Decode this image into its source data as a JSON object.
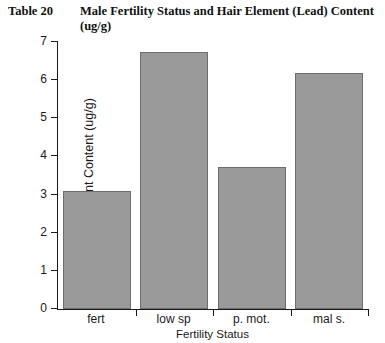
{
  "figure": {
    "table_number": "Table 20",
    "title": "Male Fertility Status and Hair Element (Lead) Content (ug/g)"
  },
  "chart_data": {
    "type": "bar",
    "title": "Male Fertility Status and Hair Element (Lead) Content (ug/g)",
    "categories": [
      "fert",
      "low sp",
      "p. mot.",
      "mal s."
    ],
    "values": [
      3.1,
      6.75,
      3.73,
      6.18
    ],
    "xlabel": "Fertility Status",
    "ylabel": "Hair Element Content (ug/g)",
    "ylim": [
      0,
      7
    ],
    "ytick_labels": [
      "0",
      "1",
      "2",
      "3",
      "4",
      "5",
      "6",
      "7"
    ],
    "ytick_values": [
      0,
      1,
      2,
      3,
      4,
      5,
      6,
      7
    ],
    "grid": false,
    "legend": false,
    "bar_color": "#9a9a9a",
    "bar_edge_color": "#6e6e6e",
    "axis_color": "#1a1a1a"
  }
}
